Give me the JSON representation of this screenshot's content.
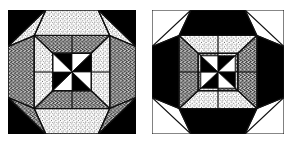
{
  "figure": {
    "kind": "quilt-block-pair",
    "count": 2,
    "canvas": {
      "width": 290,
      "height": 143,
      "background": "#ffffff"
    },
    "palette": {
      "ink": "#000000",
      "paper": "#ffffff",
      "outline": "#1a1a1a",
      "stipple_light": "#f2f2f2",
      "mottled_dark": "#4a4a4a"
    },
    "blocks": [
      {
        "id": "block-left",
        "name": "left-quilt-block",
        "label": "Left quilt block",
        "border_style": "dashed",
        "corner_fill": "black",
        "edge_fill": "white",
        "rotation_deg": 0,
        "rings": [
          {
            "name": "square-frame",
            "segments": 8,
            "fills": [
              "black",
              "white",
              "black",
              "white",
              "black",
              "white",
              "black",
              "white"
            ]
          },
          {
            "name": "outer-octagon-ring",
            "segments": 8,
            "fills": [
              "stipple",
              "mottled",
              "stipple",
              "mottled",
              "stipple",
              "mottled",
              "stipple",
              "mottled"
            ]
          },
          {
            "name": "inner-octagon-ring",
            "segments": 8,
            "fills": [
              "mottled",
              "stipple",
              "mottled",
              "stipple",
              "mottled",
              "stipple",
              "mottled",
              "stipple"
            ]
          },
          {
            "name": "center-star",
            "segments": 8,
            "fills": [
              "black",
              "white",
              "black",
              "white",
              "black",
              "white",
              "black",
              "white"
            ]
          }
        ]
      },
      {
        "id": "block-right",
        "name": "right-quilt-block",
        "label": "Right quilt block",
        "border_style": "dashed",
        "corner_fill": "white",
        "edge_fill": "black",
        "rotation_deg": 45,
        "rings": [
          {
            "name": "square-frame",
            "segments": 8,
            "fills": [
              "white",
              "black",
              "white",
              "black",
              "white",
              "black",
              "white",
              "black"
            ]
          },
          {
            "name": "outer-octagon-ring",
            "segments": 8,
            "fills": [
              "mottled",
              "stipple",
              "mottled",
              "stipple",
              "mottled",
              "stipple",
              "mottled",
              "stipple"
            ]
          },
          {
            "name": "inner-octagon-ring",
            "segments": 8,
            "fills": [
              "stipple",
              "mottled",
              "stipple",
              "mottled",
              "stipple",
              "mottled",
              "stipple",
              "mottled"
            ]
          },
          {
            "name": "center-star",
            "segments": 8,
            "fills": [
              "white",
              "black",
              "white",
              "black",
              "white",
              "black",
              "white",
              "black"
            ]
          }
        ]
      }
    ]
  }
}
